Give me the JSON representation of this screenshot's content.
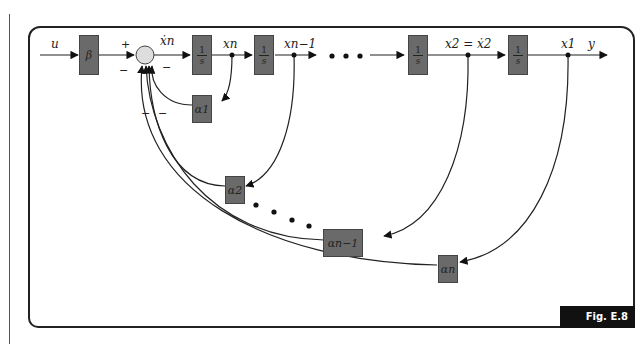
{
  "figure": {
    "tag": "Fig. E.8"
  },
  "signals": {
    "input": "u",
    "output": "y",
    "sum_output": "ẋn",
    "xn": "xn",
    "xn_1": "xn−1",
    "x2": "x2 = ẋ2",
    "x1": "x1",
    "ellipsis": "• • •"
  },
  "sum_signs": {
    "plus": "+",
    "minus": "−"
  },
  "blocks": {
    "gain": "β",
    "integrator_num": "1",
    "integrator_den": "s",
    "alpha1": "α1",
    "alpha2": "α2",
    "alpha_n_1": "αn−1",
    "alpha_n": "αn"
  },
  "colors": {
    "block_fill": "#6a6a6a",
    "line": "#222222",
    "sum_fill": "#dddddd",
    "tag_bg": "#111111"
  }
}
